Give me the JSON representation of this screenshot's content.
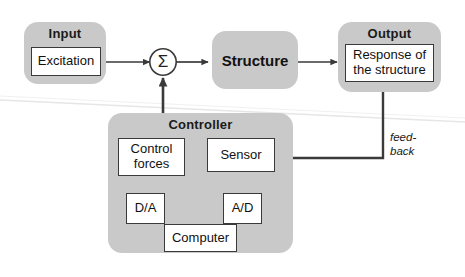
{
  "diagram": {
    "colors": {
      "group_fill": "#c9c9c9",
      "node_fill": "#ffffff",
      "stroke": "#3a3a3a",
      "text": "#111111",
      "background": "#ffffff",
      "artifact_line": "#e4e4e4"
    },
    "groups": [
      {
        "id": "input",
        "label": "Input"
      },
      {
        "id": "output",
        "label": "Output"
      },
      {
        "id": "controller",
        "label": "Controller"
      }
    ],
    "nodes": [
      {
        "id": "excitation",
        "label": "Excitation"
      },
      {
        "id": "structure",
        "label": "Structure"
      },
      {
        "id": "response",
        "label_line1": "Response of",
        "label_line2": "the structure"
      },
      {
        "id": "control_forces",
        "label_line1": "Control",
        "label_line2": "forces"
      },
      {
        "id": "sensor",
        "label": "Sensor"
      },
      {
        "id": "da",
        "label": "D/A"
      },
      {
        "id": "ad",
        "label": "A/D"
      },
      {
        "id": "computer",
        "label": "Computer"
      },
      {
        "id": "summation",
        "label": "Σ"
      }
    ],
    "annotations": [
      {
        "id": "feedback",
        "label": "feed-\nback"
      }
    ],
    "edges": [
      {
        "from": "excitation",
        "to": "summation"
      },
      {
        "from": "summation",
        "to": "structure"
      },
      {
        "from": "structure",
        "to": "response"
      },
      {
        "from": "response",
        "to": "sensor",
        "label": "feedback"
      },
      {
        "from": "sensor",
        "to": "ad"
      },
      {
        "from": "ad",
        "to": "computer"
      },
      {
        "from": "computer",
        "to": "da"
      },
      {
        "from": "da",
        "to": "control_forces"
      },
      {
        "from": "control_forces",
        "to": "summation"
      }
    ]
  }
}
